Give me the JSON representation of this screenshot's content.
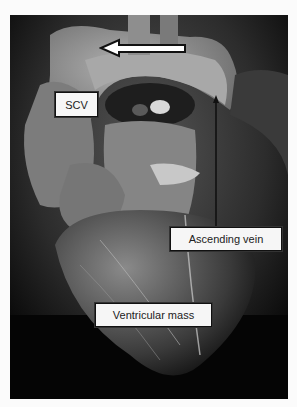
{
  "figure": {
    "labels": {
      "scv": "SCV",
      "ascending_vein": "Ascending vein",
      "ventricular_mass": "Ventricular mass"
    },
    "arrows": [
      {
        "name": "flow-arrow",
        "direction": "left",
        "style": "white outlined"
      },
      {
        "name": "ascending-vein-pointer",
        "direction": "up",
        "style": "thin black line"
      }
    ],
    "colors": {
      "background": "#fbfbfb",
      "photo_dark": "#0a0a0a",
      "tissue_light": "#9a9a9a",
      "label_fill": "#f6f6f6",
      "label_border": "#111111"
    }
  }
}
